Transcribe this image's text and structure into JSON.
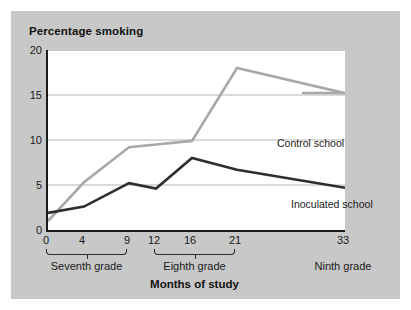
{
  "chart_data": {
    "type": "line",
    "title": "Percentage smoking",
    "xlabel": "Months of study",
    "ylabel": "Percentage smoking",
    "x": [
      0,
      4,
      9,
      12,
      16,
      21,
      33
    ],
    "xlim": [
      0,
      33
    ],
    "ylim": [
      0,
      20
    ],
    "yticks": [
      0,
      5,
      10,
      15,
      20
    ],
    "xticks": [
      0,
      4,
      9,
      12,
      16,
      21,
      33
    ],
    "grid": "horizontal",
    "legend_position": "inline-annotations",
    "series": [
      {
        "name": "Control school",
        "color": "#a8a8a8",
        "values": [
          1.0,
          5.3,
          9.2,
          9.5,
          9.9,
          18.0,
          15.2
        ]
      },
      {
        "name": "Inoculated school",
        "color": "#2e2e2e",
        "values": [
          1.9,
          2.6,
          5.2,
          4.6,
          8.0,
          6.7,
          4.7
        ]
      }
    ],
    "x_groups": [
      {
        "label": "Seventh grade",
        "from": 0,
        "to": 9
      },
      {
        "label": "Eighth grade",
        "from": 12,
        "to": 21
      },
      {
        "label": "Ninth grade",
        "from": 33,
        "to": 33,
        "bracket": false
      }
    ]
  },
  "chart": {
    "title": "Percentage smoking",
    "x_axis_title": "Months of study",
    "y_tick_labels": [
      "20",
      "15",
      "10",
      "5",
      "0"
    ],
    "x_tick_labels": [
      "0",
      "4",
      "9",
      "12",
      "16",
      "21",
      "33"
    ],
    "group_labels": [
      "Seventh grade",
      "Eighth grade",
      "Ninth grade"
    ],
    "annotations": {
      "control": "Control school",
      "inoculated": "Inoculated school"
    }
  },
  "colors": {
    "panel_background": "#c8c8c8",
    "plot_background": "#ffffff",
    "axis": "#1a1a1a",
    "gridline": "#b4b4b4",
    "control_series": "#a8a8a8",
    "inoculated_series": "#2e2e2e",
    "text": "#1a1a1a"
  }
}
